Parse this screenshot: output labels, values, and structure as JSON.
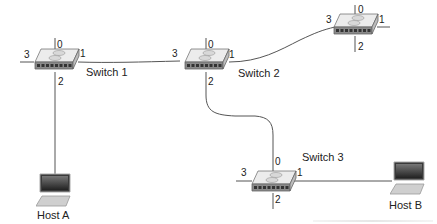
{
  "diagram": {
    "type": "network-topology",
    "colors": {
      "line": "#555555",
      "switch_top": "#e8e8e8",
      "switch_front": "#8a8a8a",
      "text": "#222222"
    },
    "switches": [
      {
        "id": "s1",
        "label": "Switch 1",
        "ports": {
          "p0": "0",
          "p1": "1",
          "p2": "2",
          "p3": "3"
        }
      },
      {
        "id": "s2",
        "label": "Switch 2",
        "ports": {
          "p0": "0",
          "p1": "1",
          "p2": "2",
          "p3": "3"
        }
      },
      {
        "id": "s4",
        "label": "",
        "ports": {
          "p0": "0",
          "p1": "1",
          "p2": "2",
          "p3": "3"
        }
      },
      {
        "id": "s3",
        "label": "Switch 3",
        "ports": {
          "p0": "0",
          "p1": "1",
          "p2": "2",
          "p3": "3"
        }
      }
    ],
    "hosts": [
      {
        "id": "hA",
        "label": "Host A"
      },
      {
        "id": "hB",
        "label": "Host B"
      }
    ],
    "links": [
      {
        "from": "Switch 1 port 1",
        "to": "Switch 2 port 3"
      },
      {
        "from": "Switch 2 port 1",
        "to": "top-right switch port 3"
      },
      {
        "from": "Switch 2 port 2",
        "to": "Switch 3 port 0"
      },
      {
        "from": "Switch 1 port 2",
        "to": "Host A"
      },
      {
        "from": "Switch 3 port 1",
        "to": "Host B"
      }
    ]
  }
}
